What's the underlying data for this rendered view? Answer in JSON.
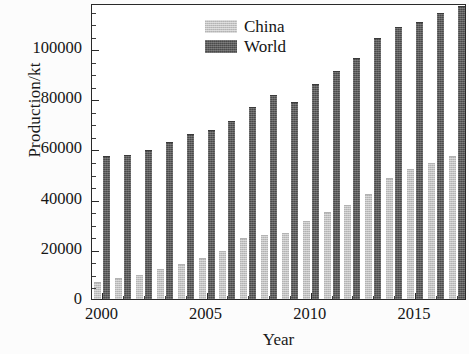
{
  "chart_data": {
    "type": "bar",
    "title": "",
    "xlabel": "Year",
    "ylabel": "Production/kt",
    "categories": [
      2000,
      2001,
      2002,
      2003,
      2004,
      2005,
      2006,
      2007,
      2008,
      2009,
      2010,
      2011,
      2012,
      2013,
      2014,
      2015,
      2016,
      2017
    ],
    "series": [
      {
        "name": "China",
        "color": "#c2c2c2",
        "values": [
          6500,
          7800,
          9200,
          11500,
          13500,
          15800,
          18800,
          23800,
          25200,
          25800,
          30800,
          34200,
          37000,
          41500,
          48000,
          51500,
          53800,
          56500
        ]
      },
      {
        "name": "World",
        "color": "#4a4a4a",
        "values": [
          56500,
          57200,
          59000,
          62000,
          65200,
          67000,
          70500,
          76000,
          81000,
          78000,
          85500,
          90500,
          95500,
          103500,
          108000,
          110000,
          113500,
          116500
        ]
      }
    ],
    "ylim": [
      0,
      118000
    ],
    "yticks": [
      0,
      20000,
      40000,
      60000,
      80000,
      100000
    ],
    "ytick_labels": [
      "0",
      "20000",
      "40000",
      "60000",
      "80000",
      "100000"
    ],
    "y_minor_step": 5000,
    "xticks": [
      2000,
      2005,
      2010,
      2015
    ],
    "xtick_labels": [
      "2000",
      "2005",
      "2010",
      "2015"
    ],
    "xlim": [
      1999.5,
      2017.5
    ],
    "grid": false,
    "legend_position": "top-left",
    "legend_entries": [
      "China",
      "World"
    ]
  },
  "figure": {
    "background_color": "#ffffff",
    "axis_color": "#2a2a2a"
  }
}
